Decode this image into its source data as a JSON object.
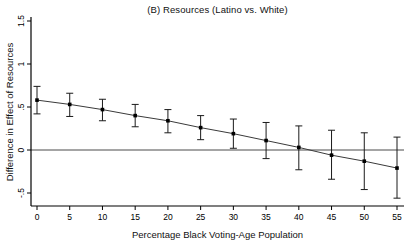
{
  "figure": {
    "title": "(B) Resources (Latino vs. White)"
  },
  "chart_data": {
    "type": "line",
    "title": "(B) Resources (Latino vs. White)",
    "xlabel": "Percentage Black Voting-Age Population",
    "ylabel": "Difference in Effect of Resources",
    "x": [
      0,
      5,
      10,
      15,
      20,
      25,
      30,
      35,
      40,
      45,
      50,
      55
    ],
    "series": [
      {
        "name": "difference-in-effect-estimate",
        "values": [
          0.58,
          0.53,
          0.47,
          0.4,
          0.34,
          0.26,
          0.19,
          0.11,
          0.03,
          -0.06,
          -0.13,
          -0.21
        ],
        "ci_lower": [
          0.42,
          0.39,
          0.34,
          0.27,
          0.2,
          0.12,
          0.02,
          -0.1,
          -0.23,
          -0.34,
          -0.46,
          -0.56
        ],
        "ci_upper": [
          0.74,
          0.66,
          0.59,
          0.53,
          0.47,
          0.4,
          0.36,
          0.32,
          0.28,
          0.23,
          0.2,
          0.15
        ]
      }
    ],
    "x_tick_labels": [
      "0",
      "5",
      "10",
      "15",
      "20",
      "25",
      "30",
      "35",
      "40",
      "45",
      "50",
      "55"
    ],
    "y_tick_labels": [
      "-.5",
      "0",
      ".5",
      "1",
      "1.5"
    ],
    "y_tick_values": [
      -0.5,
      0,
      0.5,
      1,
      1.5
    ],
    "xlim": [
      -1,
      56
    ],
    "ylim": [
      -0.65,
      1.55
    ],
    "grid": false,
    "zero_reference_line": true,
    "legend": "none",
    "marker": "square",
    "error_bars": "capped",
    "colors": {
      "line": "#3a3a3a",
      "marker": "#000000",
      "error_bar": "#1a1a1a",
      "axis": "#000000",
      "zero_line": "#4a4a4a",
      "text": "#000000",
      "background": "#ffffff"
    }
  }
}
